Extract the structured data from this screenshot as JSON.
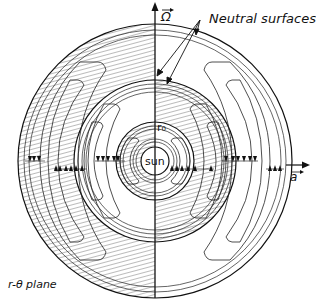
{
  "diagram": {
    "type": "cross-section schematic",
    "labels": {
      "neutral_surfaces": "Neutral surfaces",
      "plane": "r-θ plane",
      "omega_vector": "Ω",
      "a_vector": "a",
      "sun": "sun",
      "r0": "r₀"
    },
    "geometry": {
      "center": [
        155,
        161
      ],
      "outer_radius": 137,
      "middle_radius": 81,
      "inner_radius": 39,
      "sun_radius": 14
    },
    "colors": {
      "line": "#111111",
      "hatch": "#555555",
      "background": "#ffffff"
    }
  }
}
